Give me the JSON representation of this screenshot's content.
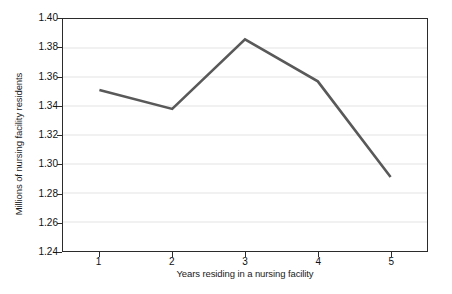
{
  "chart_data": {
    "type": "line",
    "title": "",
    "xlabel": "Years residing in a nursing facility",
    "ylabel": "Millions of nursing facility residents",
    "x": [
      1,
      2,
      3,
      4,
      5
    ],
    "categories": [
      "1",
      "2",
      "3",
      "4",
      "5"
    ],
    "values": [
      1.351,
      1.338,
      1.386,
      1.357,
      1.291
    ],
    "series": [
      {
        "name": "Nursing facility residents",
        "values": [
          1.351,
          1.338,
          1.386,
          1.357,
          1.291
        ]
      }
    ],
    "xlim": [
      0.5,
      5.5
    ],
    "ylim": [
      1.24,
      1.4
    ],
    "ytick_values": [
      1.4,
      1.38,
      1.36,
      1.34,
      1.32,
      1.3,
      1.28,
      1.26,
      1.24
    ],
    "ytick_labels": [
      "1.40",
      "1.38",
      "1.36",
      "1.34",
      "1.32",
      "1.30",
      "1.28",
      "1.26",
      "1.24"
    ],
    "xtick_values": [
      1,
      2,
      3,
      4,
      5
    ],
    "xtick_labels": [
      "1",
      "2",
      "3",
      "4",
      "5"
    ],
    "grid": "horizontal",
    "legend": "none",
    "line_color": "#595959",
    "grid_color": "#e3e3e3",
    "frame_color": "#2b2b2b",
    "background_color": "#ffffff",
    "line_width": 2.6,
    "markers": "none"
  }
}
